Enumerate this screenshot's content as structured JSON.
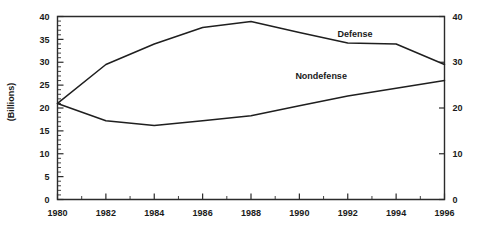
{
  "chart_data": {
    "type": "line",
    "title": "",
    "xlabel": "",
    "ylabel": "(Billions)",
    "x": [
      1980,
      1982,
      1984,
      1986,
      1988,
      1990,
      1992,
      1994,
      1996
    ],
    "xlim": [
      1980,
      1996
    ],
    "ylim": [
      0,
      40
    ],
    "y_left_ticks": [
      0,
      5,
      10,
      15,
      20,
      25,
      30,
      35,
      40
    ],
    "y_right_ticks": [
      0,
      10,
      20,
      30,
      40
    ],
    "x_ticks": [
      1980,
      1982,
      1984,
      1986,
      1988,
      1990,
      1992,
      1994,
      1996
    ],
    "x_minor_ticks": [
      1981,
      1983,
      1985,
      1987,
      1989,
      1991,
      1993,
      1995
    ],
    "y_minor_tick_step": 1,
    "grid": false,
    "legend_position": "inline-labels",
    "series": [
      {
        "name": "Defense",
        "values": [
          21.0,
          29.5,
          34.0,
          37.6,
          38.9,
          36.5,
          34.2,
          34.0,
          29.5
        ],
        "color": "#1f1f1f"
      },
      {
        "name": "Nondefense",
        "values": [
          21.0,
          17.2,
          16.2,
          17.2,
          18.3,
          20.5,
          22.6,
          24.3,
          26.0
        ],
        "color": "#1f1f1f"
      }
    ],
    "annotations": [
      {
        "text": "Defense",
        "x": 1992.3,
        "y": 35.6
      },
      {
        "text": "Nondefense",
        "x": 1990.9,
        "y": 26.4
      }
    ]
  },
  "axes": {
    "left_labels": [
      "40",
      "35",
      "30",
      "25",
      "20",
      "15",
      "10",
      "5",
      "0"
    ],
    "right_labels": [
      "40",
      "30",
      "20",
      "10",
      "0"
    ],
    "x_labels": [
      "1980",
      "1982",
      "1984",
      "1986",
      "1988",
      "1990",
      "1992",
      "1994",
      "1996"
    ],
    "y_axis_title": "(Billions)"
  },
  "labels": {
    "defense": "Defense",
    "nondefense": "Nondefense"
  }
}
